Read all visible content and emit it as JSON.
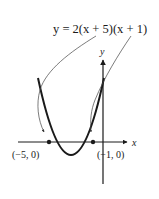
{
  "figure": {
    "equation_label": "y = 2(x + 5)(x + 1)",
    "x_axis_label": "x",
    "y_axis_label": "y",
    "points": [
      {
        "label": "(−5, 0)",
        "x": -5,
        "y": 0
      },
      {
        "label": "(−1, 0)",
        "x": -1,
        "y": 0
      }
    ],
    "curve": {
      "type": "parabola",
      "a": 2,
      "roots": [
        -5,
        -1
      ],
      "vertex": {
        "x": -3,
        "y": -8
      }
    },
    "colors": {
      "curve": "#1a1a1a",
      "axes": "#1a1a1a",
      "leader": "#555555"
    }
  }
}
